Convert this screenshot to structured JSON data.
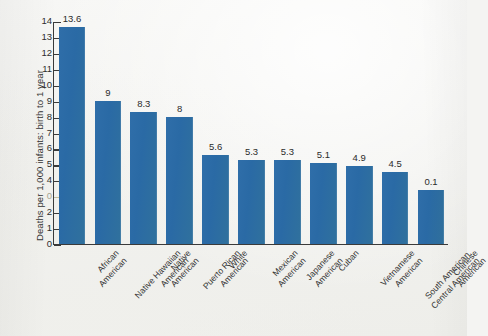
{
  "chart_data": {
    "type": "bar",
    "title": "",
    "xlabel": "",
    "ylabel": "Deaths per 1,000 infants: birth to 1 year",
    "ylim": [
      0,
      14
    ],
    "grid": false,
    "legend": "none",
    "orientation": "vertical",
    "bar_color": "#2f6ea9",
    "ytick_labels": [
      "14",
      "13",
      "12",
      "11",
      "10",
      "9",
      "8",
      "7",
      "6",
      "5",
      "4",
      "0",
      "2",
      "1",
      "0"
    ],
    "ytick_values": [
      14,
      13,
      12,
      11,
      10,
      9,
      8,
      7,
      6,
      5,
      4,
      3,
      2,
      1,
      0
    ],
    "categories": [
      "African\nAmerican",
      "Native Hawaiian\nAmerican",
      "Native\nAmerican",
      "Puerto Rican\nAmerican",
      "White",
      "Mexican\nAmerican",
      "Japanese\nAmerican",
      "Cuban",
      "Vietnamese\nAmerican",
      "South American,\nCentral American",
      "Chinese\nAmerican"
    ],
    "values": [
      13.6,
      9,
      8.3,
      8,
      5.6,
      5.3,
      5.3,
      5.1,
      4.9,
      4.5,
      3.4
    ],
    "data_labels": [
      "13.6",
      "9",
      "8.3",
      "8",
      "5.6",
      "5.3",
      "5.3",
      "5.1",
      "4.9",
      "4.5",
      "0.1"
    ]
  },
  "axis": {
    "y_title": "Deaths per 1,000 infants: birth to 1 year"
  }
}
